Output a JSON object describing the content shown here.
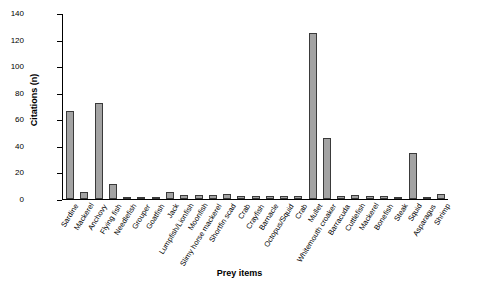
{
  "chart_data": {
    "type": "bar",
    "title": "",
    "xlabel": "Prey items",
    "ylabel": "Citations (n)",
    "ylim": [
      0,
      140
    ],
    "yticks": [
      0,
      20,
      40,
      60,
      80,
      100,
      120,
      140
    ],
    "grid": false,
    "legend": "none",
    "bar_color": "#a3a3a3",
    "bar_edge_color": "#3a3a3a",
    "categories": [
      "Sardine",
      "Mackerel",
      "Anchovy",
      "Flying fish",
      "Needlefish",
      "Grouper",
      "Goatfish",
      "Jack",
      "Lumpfish/Lionfish",
      "Moonfish",
      "Slimy horse mackerel",
      "Shortfin scad",
      "Crab",
      "Crayfish",
      "Barnacle",
      "Octopus/Squid",
      "Crab",
      "Mullet",
      "Whitemouth croaker",
      "Barracuda",
      "Cuttlefish",
      "Mackerel",
      "Bonefish",
      "Steak",
      "Squid",
      "Asparagus",
      "Shrimp"
    ],
    "values": [
      66,
      5,
      72,
      11,
      1,
      1,
      1,
      5,
      3,
      3,
      3,
      4,
      2,
      2,
      2,
      2,
      2,
      125,
      46,
      2,
      3,
      2,
      2,
      1,
      35,
      1,
      4
    ]
  }
}
